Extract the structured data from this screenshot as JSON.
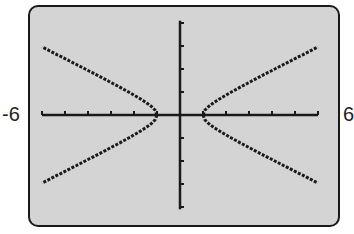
{
  "chart_data": {
    "type": "line",
    "title": "",
    "xlabel": "",
    "ylabel": "",
    "xlim": [
      -6,
      6
    ],
    "ylim": [
      -4,
      4
    ],
    "x_tick_step": 1,
    "y_tick_step": 1,
    "grid": false,
    "legend": null,
    "window_labels": {
      "xmin": "-6",
      "xmax": "6"
    },
    "series": [
      {
        "name": "hyperbola x^2 - 4y^2 = 1 (upper right)",
        "x": [
          1,
          1.5,
          2,
          3,
          4,
          5,
          6
        ],
        "y": [
          0,
          0.56,
          0.87,
          1.41,
          1.94,
          2.45,
          2.96
        ]
      },
      {
        "name": "hyperbola x^2 - 4y^2 = 1 (lower right)",
        "x": [
          1,
          1.5,
          2,
          3,
          4,
          5,
          6
        ],
        "y": [
          0,
          -0.56,
          -0.87,
          -1.41,
          -1.94,
          -2.45,
          -2.96
        ]
      },
      {
        "name": "hyperbola x^2 - 4y^2 = 1 (upper left)",
        "x": [
          -1,
          -1.5,
          -2,
          -3,
          -4,
          -5,
          -6
        ],
        "y": [
          0,
          0.56,
          0.87,
          1.41,
          1.94,
          2.45,
          2.96
        ]
      },
      {
        "name": "hyperbola x^2 - 4y^2 = 1 (lower left)",
        "x": [
          -1,
          -1.5,
          -2,
          -3,
          -4,
          -5,
          -6
        ],
        "y": [
          0,
          -0.56,
          -0.87,
          -1.41,
          -1.94,
          -2.45,
          -2.96
        ]
      }
    ]
  },
  "labels": {
    "xmin": "-6",
    "xmax": "6"
  },
  "colors": {
    "screen_bg": "#d4d4d4",
    "ink": "#1a1a1a"
  }
}
